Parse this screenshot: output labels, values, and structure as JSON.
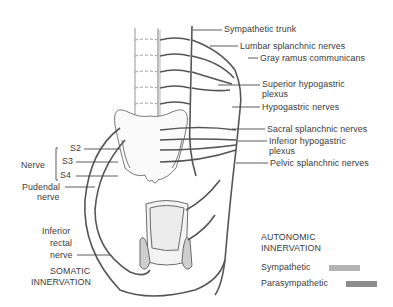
{
  "labels": {
    "sympathetic_trunk": "Sympathetic trunk",
    "lumbar_splanchnic": "Lumbar splanchnic nerves",
    "gray_ramus": "Gray ramus communicans",
    "superior_hypogastric_1": "Superior hypogastric",
    "superior_hypogastric_2": "plexus",
    "hypogastric_nerves": "Hypogastric nerves",
    "sacral_splanchnic": "Sacral splanchnic nerves",
    "inferior_hypogastric_1": "Inferior hypogastric",
    "inferior_hypogastric_2": "plexus",
    "pelvic_splanchnic": "Pelvic splanchnic nerves",
    "nerve": "Nerve",
    "s2": "S2",
    "s3": "S3",
    "s4": "S4",
    "pudendal_1": "Pudendal",
    "pudendal_2": "nerve",
    "inferior_rectal_1": "Inferior",
    "inferior_rectal_2": "rectal",
    "inferior_rectal_3": "nerve",
    "somatic_1": "SOMATIC",
    "somatic_2": "INNERVATION"
  },
  "legend": {
    "title_1": "AUTONOMIC",
    "title_2": "INNERVATION",
    "items": [
      {
        "label": "Sympathetic",
        "color": "#b4b4b4"
      },
      {
        "label": "Parasympathetic",
        "color": "#8c8c8c"
      }
    ]
  },
  "colors": {
    "nerve_stroke": "#555555",
    "bone_stroke": "#7a7a7a",
    "leader": "#4a4a4a"
  }
}
